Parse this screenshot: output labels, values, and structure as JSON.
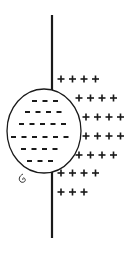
{
  "diagram": {
    "colors": {
      "stroke": "#1a1a1a",
      "background": "#ffffff"
    },
    "wire": {
      "x": 52,
      "top_y1": 15,
      "top_y2": 90,
      "bottom_y1": 172,
      "bottom_y2": 238
    },
    "sphere": {
      "cx": 44,
      "cy": 131,
      "rx": 37,
      "ry": 42
    },
    "negative_rows": [
      {
        "y": 101,
        "x_start": 32,
        "count": 3,
        "symbol": "-"
      },
      {
        "y": 112,
        "x_start": 25,
        "count": 4,
        "symbol": "-"
      },
      {
        "y": 124,
        "x_start": 19,
        "count": 5,
        "symbol": "-"
      },
      {
        "y": 137,
        "x_start": 11,
        "count": 6,
        "symbol": "-"
      },
      {
        "y": 149,
        "x_start": 21,
        "count": 4,
        "symbol": "-"
      },
      {
        "y": 161,
        "x_start": 27,
        "count": 3,
        "symbol": "-"
      }
    ],
    "positive_rows": [
      {
        "y": 79,
        "x_start": 58,
        "count": 4,
        "symbol": "+"
      },
      {
        "y": 98,
        "x_start": 76,
        "count": 4,
        "symbol": "+"
      },
      {
        "y": 117,
        "x_start": 83,
        "count": 4,
        "symbol": "+"
      },
      {
        "y": 136,
        "x_start": 83,
        "count": 4,
        "symbol": "+"
      },
      {
        "y": 155,
        "x_start": 76,
        "count": 4,
        "symbol": "+"
      },
      {
        "y": 173,
        "x_start": 58,
        "count": 4,
        "symbol": "+"
      },
      {
        "y": 192,
        "x_start": 58,
        "count": 3,
        "symbol": "+"
      }
    ],
    "hanger_icon": "hook-icon"
  }
}
